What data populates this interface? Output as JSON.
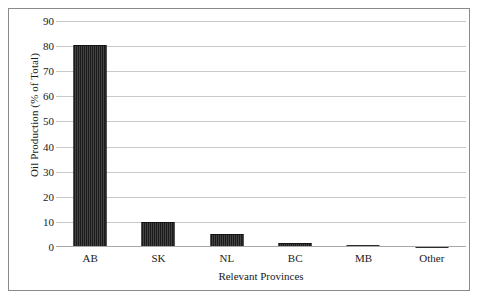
{
  "chart_data": {
    "type": "bar",
    "title": "",
    "xlabel": "Relevant Provinces",
    "ylabel": "Oil Production (% of Total)",
    "categories": [
      "AB",
      "SK",
      "NL",
      "BC",
      "MB",
      "Other"
    ],
    "values": [
      80.5,
      10.0,
      5.0,
      1.7,
      0.7,
      0.1
    ],
    "ylim": [
      0,
      90
    ],
    "ytick_labels": [
      "0",
      "10",
      "20",
      "30",
      "40",
      "50",
      "60",
      "70",
      "80",
      "90"
    ],
    "ytick_values": [
      0,
      10,
      20,
      30,
      40,
      50,
      60,
      70,
      80,
      90
    ],
    "grid": true,
    "legend": false,
    "bar_color": "#2b2b2b",
    "gridline_color": "#c9c9c9",
    "frame_color": "#8a8a8a",
    "text_color": "#1a1a1a"
  }
}
